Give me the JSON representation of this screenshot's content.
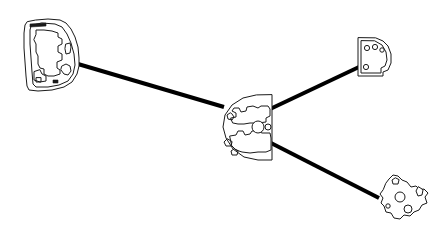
{
  "canvas": {
    "width": 442,
    "height": 235,
    "background_color": "#ffffff",
    "stroke_color": "#1a1a1a",
    "edge_color": "#000000",
    "title": "Line-art shape node diagram"
  },
  "chart_data": {
    "type": "diagram",
    "layout": "radial",
    "nodes": [
      {
        "id": "node-left",
        "label": "left-outline-shape",
        "shape": "irregular-rounded-polygon",
        "center_x": 55,
        "center_y": 56,
        "width": 66,
        "height": 78,
        "anchor_x": 78,
        "anchor_y": 64,
        "fill": "#ffffff",
        "stroke": "#1a1a1a"
      },
      {
        "id": "node-center",
        "label": "center-d-shape-hub",
        "shape": "half-disc",
        "center_x": 247,
        "center_y": 128,
        "width": 55,
        "height": 70,
        "anchor_x": 222,
        "anchor_y": 106,
        "fill": "#ffffff",
        "stroke": "#1a1a1a"
      },
      {
        "id": "node-top-right",
        "label": "top-right-quarter-disc",
        "shape": "quarter-disc",
        "center_x": 372,
        "center_y": 57,
        "width": 32,
        "height": 33,
        "anchor_x": 359,
        "anchor_y": 67,
        "fill": "#ffffff",
        "stroke": "#1a1a1a"
      },
      {
        "id": "node-bottom-right",
        "label": "bottom-right-puzzle-shape",
        "shape": "irregular-polygon",
        "center_x": 400,
        "center_y": 199,
        "width": 53,
        "height": 48,
        "anchor_x": 379,
        "anchor_y": 198,
        "fill": "#ffffff",
        "stroke": "#1a1a1a"
      }
    ],
    "edges": [
      {
        "id": "edge-left-center",
        "from": "node-left",
        "to": "node-center",
        "x1": 78,
        "y1": 64,
        "x2": 224,
        "y2": 107,
        "width": 4,
        "color": "#000000"
      },
      {
        "id": "edge-center-top-right",
        "from": "node-center",
        "to": "node-top-right",
        "x1": 268,
        "y1": 110,
        "x2": 359,
        "y2": 67,
        "width": 4,
        "color": "#000000"
      },
      {
        "id": "edge-center-bottom-right",
        "from": "node-center",
        "to": "node-bottom-right",
        "x1": 271,
        "y1": 143,
        "x2": 379,
        "y2": 198,
        "width": 4,
        "color": "#000000"
      }
    ],
    "node_count": 4,
    "edge_count": 3,
    "grid": false,
    "legend": false,
    "axis_labels": false
  },
  "paths": {
    "left_outline": "M27,22 L25,25 L24,33 L24,48 L25,62 L26,76 L27,86 L29,90 L38,91 L52,90 L64,87 L72,82 L77,74 L79,66 L79,58 L78,47 L75,37 L71,29 L66,23 L60,20 L48,19 L36,20 Z",
    "left_inner_frame": "M31,26 L30,30 L30,44 L31,58 L32,72 L33,84 L36,87 L48,87 L59,85 L68,81 L73,74 L75,65 L74,54 L71,43 L67,34 L62,27 L55,24 L42,23 Z",
    "left_inner_detail_a": "M36,34 L36,30 L44,30 L52,31 L58,33 L58,37 L62,39 L62,44 L58,46 L58,52 L62,54 L62,60 L57,62 L57,68 L60,70 L60,74 L54,76 L48,76 L44,74 L44,69 L40,68 L38,64 L38,56 L36,52 L36,44 L34,40 Z",
    "left_inner_detail_b": "M34,72 L34,80 L40,82 L46,81 L46,76 L42,74 L40,70 Z",
    "left_notch_right": "M66,44 L70,43 L71,47 L70,53 L66,54 L65,49 Z",
    "left_bump_lower": "M62,66 L66,64 L70,66 L71,71 L68,75 L64,74 L61,70 Z",
    "left_top_bar": "M30,24 L30,27 L46,26 L46,23 Z",
    "left_mark_a": "M36,78 L36,82 L41,82 L41,78 Z",
    "left_mark_b": "M53,80 L53,83 L58,83 L58,80 Z",
    "center_dshape": "M272,95 L272,160 L258,160 L244,157 L233,149 L226,138 L223,127 L225,115 L232,105 L243,98 L256,95 Z",
    "center_detail_upper": "M231,118 L236,117 L236,113 L232,111 L234,108 L239,108 L241,112 L246,111 L247,107 L253,106 L258,108 L261,106 L268,106 L270,109 L270,116 L266,118 L266,122 L258,123 L250,123 L244,124 L238,124 L233,123 Z",
    "center_detail_lower": "M230,136 L236,135 L238,131 L243,131 L245,135 L250,134 L252,131 L258,131 L262,133 L270,133 L271,138 L271,150 L266,152 L258,152 L250,153 L242,152 L236,150 L232,146 Z",
    "center_swirl_a": "M230,113 L227,115 L228,119 L232,120 L234,117 L232,114 Z",
    "center_swirl_b": "M227,139 L224,142 L226,146 L231,146 L232,142 Z",
    "center_swirl_c": "M234,149 L231,151 L232,155 L237,155 L238,151 Z",
    "center_circle_big": {
      "cx": 258,
      "cy": 127,
      "r": 6
    },
    "center_circle_small": {
      "cx": 268,
      "cy": 127,
      "r": 3
    },
    "tr_outline": "M358,38 L358,76 L383,76 L383,72 L388,70 L391,63 L391,54 L388,46 L383,41 L376,38 Z",
    "tr_inner": "M361,41 L361,73 L381,73 L381,68 L385,66 L387,60 L386,52 L382,45 L375,41 Z",
    "tr_circle_a": {
      "cx": 367,
      "cy": 48,
      "r": 2.6
    },
    "tr_circle_b": {
      "cx": 375,
      "cy": 47,
      "r": 2.6
    },
    "tr_circle_c": {
      "cx": 382,
      "cy": 50,
      "r": 2.2
    },
    "tr_circle_d": {
      "cx": 366,
      "cy": 67,
      "r": 2.6
    },
    "br_outline": "M383,190 L380,194 L383,198 L381,203 L384,206 L386,212 L391,213 L394,218 L400,219 L404,215 L410,216 L414,212 L419,210 L422,205 L427,203 L425,197 L428,193 L424,189 L420,190 L416,186 L411,187 L407,182 L402,180 L398,176 L393,175 L389,179 L386,183 Z",
    "br_circle_a": {
      "cx": 400,
      "cy": 197,
      "r": 5
    },
    "br_circle_b": {
      "cx": 408,
      "cy": 209,
      "r": 4
    },
    "br_circle_c": {
      "cx": 388,
      "cy": 206,
      "r": 2.2
    },
    "br_tab": "M418,187 L416,191 L418,196 L422,195 L423,190 Z",
    "br_notch": "M395,178 L392,180 L393,184 L398,184 L399,180 Z"
  },
  "accessibility": {
    "description": "Four white line-art outlined shapes connected by three thick black straight edges radiating from a central half-disc hub."
  }
}
